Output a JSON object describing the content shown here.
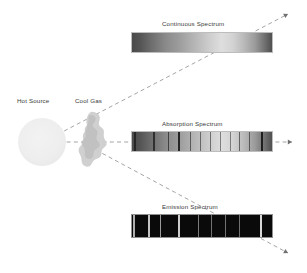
{
  "diagram": {
    "title_hidden": "",
    "background_color": "#ffffff",
    "ray_color": "#9a9a9a",
    "text_color": "#3a3a3a"
  },
  "source": {
    "label": "Hot Source",
    "label_x": 17,
    "label_y": 98,
    "center_x": 42,
    "center_y": 142,
    "radius": 24,
    "color": "#eeeeee"
  },
  "gas_cloud": {
    "label": "Cool Gas",
    "label_x": 75,
    "label_y": 98,
    "center_x": 93,
    "center_y": 139,
    "color": "#cccccc"
  },
  "rays": [
    {
      "name": "ray-up-continuous",
      "x1": 45,
      "y1": 141,
      "x2": 288,
      "y2": 14,
      "arrowhead": true
    },
    {
      "name": "ray-horizontal-absorption",
      "x1": 45,
      "y1": 142,
      "x2": 292,
      "y2": 142,
      "arrowhead": true
    },
    {
      "name": "ray-down-emission",
      "x1": 96,
      "y1": 150,
      "x2": 288,
      "y2": 253,
      "arrowhead": true
    }
  ],
  "spectra": [
    {
      "key": "continuous",
      "label": "Continuous Spectrum",
      "label_x": 202,
      "label_y": 21,
      "x": 131,
      "y": 32,
      "width": 142,
      "height": 21,
      "type": "continuous",
      "description": "smooth grayscale gradient, no lines",
      "lines": []
    },
    {
      "key": "absorption",
      "label": "Absorption Spectrum",
      "label_x": 202,
      "label_y": 121,
      "x": 131,
      "y": 131,
      "width": 142,
      "height": 21,
      "type": "absorption",
      "description": "gradient crossed by dark vertical absorption lines",
      "line_color": "#1f1f1f",
      "lines": [
        {
          "pos": 2.0,
          "w": 1.4,
          "strength": 0.85
        },
        {
          "pos": 15.5,
          "w": 1.2,
          "strength": 0.8
        },
        {
          "pos": 26.0,
          "w": 1.0,
          "strength": 0.7
        },
        {
          "pos": 33.0,
          "w": 1.6,
          "strength": 0.95
        },
        {
          "pos": 41.0,
          "w": 0.9,
          "strength": 0.6
        },
        {
          "pos": 48.0,
          "w": 0.9,
          "strength": 0.55
        },
        {
          "pos": 55.0,
          "w": 0.9,
          "strength": 0.55
        },
        {
          "pos": 62.0,
          "w": 0.9,
          "strength": 0.5
        },
        {
          "pos": 69.0,
          "w": 0.9,
          "strength": 0.5
        },
        {
          "pos": 76.0,
          "w": 1.0,
          "strength": 0.6
        },
        {
          "pos": 83.0,
          "w": 1.0,
          "strength": 0.6
        },
        {
          "pos": 91.5,
          "w": 1.8,
          "strength": 1.0
        },
        {
          "pos": 99.0,
          "w": 1.2,
          "strength": 0.8
        }
      ]
    },
    {
      "key": "emission",
      "label": "Emission Spectrum",
      "label_x": 202,
      "label_y": 204,
      "x": 131,
      "y": 214,
      "width": 142,
      "height": 24,
      "type": "emission",
      "description": "black band with bright vertical emission lines",
      "background_color": "#0a0a0a",
      "line_color": "#d8d8d8",
      "lines": [
        {
          "pos": 1.5,
          "w": 1.4,
          "strength": 0.8
        },
        {
          "pos": 12.0,
          "w": 1.6,
          "strength": 0.9
        },
        {
          "pos": 20.0,
          "w": 1.2,
          "strength": 0.7
        },
        {
          "pos": 33.0,
          "w": 1.8,
          "strength": 0.95
        },
        {
          "pos": 47.0,
          "w": 1.0,
          "strength": 0.55
        },
        {
          "pos": 56.0,
          "w": 1.0,
          "strength": 0.5
        },
        {
          "pos": 66.0,
          "w": 1.0,
          "strength": 0.5
        },
        {
          "pos": 76.0,
          "w": 1.0,
          "strength": 0.5
        },
        {
          "pos": 91.0,
          "w": 2.0,
          "strength": 1.0
        },
        {
          "pos": 99.0,
          "w": 1.4,
          "strength": 0.85
        }
      ]
    }
  ]
}
